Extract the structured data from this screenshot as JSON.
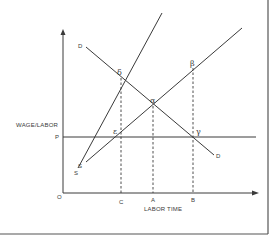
{
  "diagram": {
    "axes": {
      "y_label": "WAGE/LABOR",
      "x_label": "LABOR TIME",
      "origin_label": "O",
      "price_label": "P"
    },
    "x_ticks": [
      {
        "label": "C"
      },
      {
        "label": "A"
      },
      {
        "label": "B"
      }
    ],
    "curves": {
      "demand": {
        "start_label": "D",
        "end_label": "D"
      },
      "supply_steep": {
        "label": "S"
      },
      "supply_shallow": {
        "label": "S"
      }
    },
    "points": {
      "delta": "δ",
      "alpha": "α",
      "beta": "β",
      "epsilon": "ε",
      "gamma": "γ"
    },
    "colors": {
      "line": "#3a3a3a",
      "frame": "#555555",
      "background": "#ffffff"
    }
  }
}
